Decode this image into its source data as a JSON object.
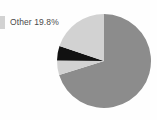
{
  "background_color": "#fefefe",
  "legend": {
    "swatch_color": "#d2d2d2",
    "label": "Other 19.8%"
  },
  "chart_data": {
    "type": "pie",
    "title": "",
    "legend_position": "left",
    "labels": [
      "Main",
      "Other",
      "Segment C",
      "Segment D"
    ],
    "values": [
      70.2,
      19.8,
      5.0,
      5.0
    ],
    "unit": "%",
    "annotations": [
      "Other 19.8%"
    ],
    "colors": [
      "#8c8c8c",
      "#d2d2d2",
      "#111111",
      "#d2d2d2"
    ],
    "start_angle_deg": 0,
    "direction": "clockwise",
    "center_x": 48,
    "center_y": 48,
    "radius": 47,
    "slices": [
      {
        "name": "Main",
        "value": 70.2,
        "color": "#8c8c8c",
        "start_deg": 0.0,
        "end_deg": 252.7
      },
      {
        "name": "Segment D",
        "value": 5.0,
        "color": "#d2d2d2",
        "start_deg": 252.7,
        "end_deg": 270.7
      },
      {
        "name": "Segment C",
        "value": 5.0,
        "color": "#111111",
        "start_deg": 270.7,
        "end_deg": 288.7
      },
      {
        "name": "Other",
        "value": 19.8,
        "color": "#d2d2d2",
        "start_deg": 288.7,
        "end_deg": 360.0
      }
    ]
  }
}
